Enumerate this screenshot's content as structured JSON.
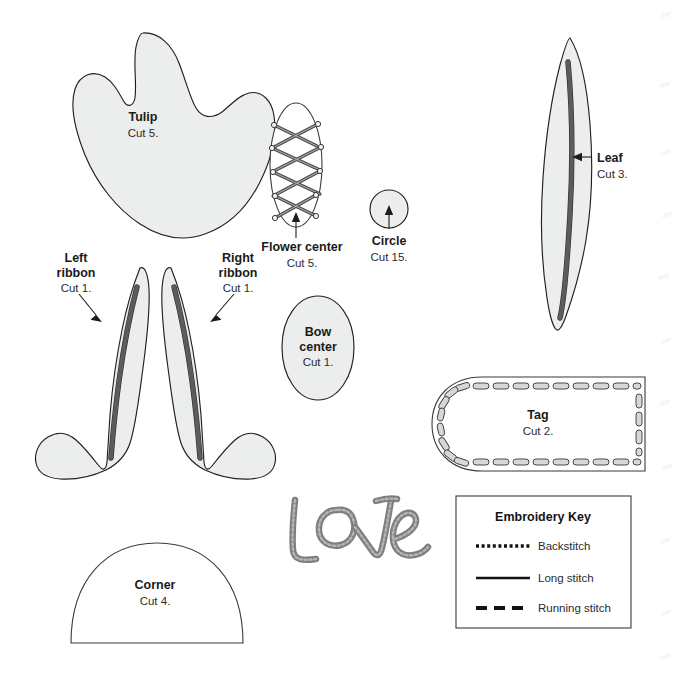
{
  "sheet": {
    "background_color": "#ffffff",
    "outline_color": "#23201f",
    "piece_fill_color": "#eceded",
    "stitch_color": "#5d5b5c"
  },
  "pieces": [
    {
      "id": "tulip",
      "name": "Tulip",
      "cut": "Cut 5.",
      "fill": "gray",
      "has_arrow": false
    },
    {
      "id": "flower-center",
      "name": "Flower center",
      "cut": "Cut 5.",
      "fill": "white",
      "has_arrow": true
    },
    {
      "id": "circle",
      "name": "Circle",
      "cut": "Cut 15.",
      "fill": "gray",
      "has_arrow": true
    },
    {
      "id": "leaf",
      "name": "Leaf",
      "cut": "Cut 3.",
      "fill": "gray",
      "has_arrow": true
    },
    {
      "id": "left-ribbon",
      "name_line1": "Left",
      "name_line2": "ribbon",
      "cut": "Cut 1.",
      "fill": "gray",
      "has_arrow": true
    },
    {
      "id": "right-ribbon",
      "name_line1": "Right",
      "name_line2": "ribbon",
      "cut": "Cut 1.",
      "fill": "gray",
      "has_arrow": true
    },
    {
      "id": "bow-center",
      "name_line1": "Bow",
      "name_line2": "center",
      "cut": "Cut 1.",
      "fill": "gray",
      "has_arrow": false
    },
    {
      "id": "tag",
      "name": "Tag",
      "cut": "Cut 2.",
      "fill": "white",
      "has_arrow": false
    },
    {
      "id": "corner",
      "name": "Corner",
      "cut": "Cut 4.",
      "fill": "white",
      "has_arrow": false
    }
  ],
  "labels": {
    "tulip": {
      "title": "Tulip",
      "sub": "Cut 5."
    },
    "flower_center": {
      "title": "Flower center",
      "sub": "Cut 5."
    },
    "circle": {
      "title": "Circle",
      "sub": "Cut 15."
    },
    "leaf": {
      "title": "Leaf",
      "sub": "Cut 3."
    },
    "left_ribbon": {
      "title_1": "Left",
      "title_2": "ribbon",
      "sub": "Cut 1."
    },
    "right_ribbon": {
      "title_1": "Right",
      "title_2": "ribbon",
      "sub": "Cut 1."
    },
    "bow_center": {
      "title_1": "Bow",
      "title_2": "center",
      "sub": "Cut 1."
    },
    "tag": {
      "title": "Tag",
      "sub": "Cut 2."
    },
    "corner": {
      "title": "Corner",
      "sub": "Cut 4."
    }
  },
  "lettering": {
    "word": "Love",
    "style": "embroidered-script",
    "stitch_color": "#807e7e"
  },
  "embroidery_key": {
    "title": "Embroidery Key",
    "entries": [
      {
        "label": "Backstitch",
        "style": "dotted",
        "dash": "3 2.6",
        "width": 3.4
      },
      {
        "label": "Long stitch",
        "style": "solid",
        "dash": "none",
        "width": 2.6
      },
      {
        "label": "Running stitch",
        "style": "dashed",
        "dash": "11 7",
        "width": 4.0
      }
    ]
  }
}
